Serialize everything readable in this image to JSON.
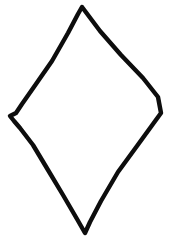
{
  "figure": {
    "title": "Rhombus outline",
    "shape_name": "rhombus",
    "alt_names": "diamond, lozenge",
    "style": "hand-drawn line drawing",
    "width": 171,
    "height": 242,
    "background_color": "#ffffff",
    "stroke_color": "#0d0d0d",
    "fill_color": "none",
    "stroke_width": 4.4,
    "vertex_labels": [
      "top",
      "right",
      "bottom",
      "left"
    ],
    "vertices": [
      {
        "label": "top",
        "x": 82,
        "y": 7
      },
      {
        "label": "right",
        "x": 161,
        "y": 113
      },
      {
        "label": "bottom",
        "x": 85,
        "y": 233
      },
      {
        "label": "left",
        "x": 10,
        "y": 116
      }
    ],
    "path_d": "M 82 7 L 100 31 L 121 55 L 143 78 L 158 97 L 161 113 L 153 124 L 137 146 L 118 172 L 101 201 L 90 222 L 85 233 L 77 219 L 63 195 L 48 170 L 33 145 L 20 128 L 14 121 L 10 116 L 16 113 L 22 104 L 36 84 L 52 61 L 68 33 L 78 14 Z"
  }
}
